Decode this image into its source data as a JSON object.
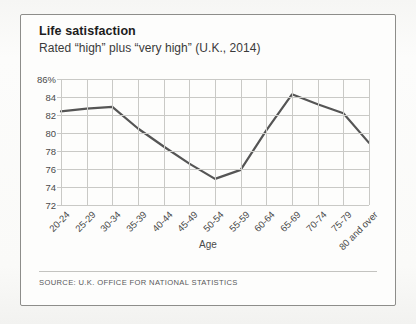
{
  "card": {
    "title": "Life satisfaction",
    "subtitle": "Rated “high” plus “very high” (U.K., 2014)",
    "source": "SOURCE: U.K. OFFICE FOR NATIONAL STATISTICS"
  },
  "chart_data": {
    "type": "line",
    "title": "Life satisfaction",
    "subtitle": "Rated “high” plus “very high” (U.K., 2014)",
    "xlabel": "Age",
    "ylabel": "",
    "categories": [
      "20-24",
      "25-29",
      "30-34",
      "35-39",
      "40-44",
      "45-49",
      "50-54",
      "55-59",
      "60-64",
      "65-69",
      "70-74",
      "75-79",
      "80 and over"
    ],
    "values": [
      82.4,
      82.7,
      82.9,
      80.5,
      78.5,
      76.6,
      74.9,
      75.9,
      80.3,
      84.3,
      83.2,
      82.2,
      78.9
    ],
    "ylim": [
      72,
      86
    ],
    "ytick_labels": [
      "86%",
      "84",
      "82",
      "80",
      "78",
      "76",
      "74",
      "72"
    ],
    "yticks": [
      86,
      84,
      82,
      80,
      78,
      76,
      74,
      72
    ],
    "grid": true,
    "legend": false,
    "line_color": "#555555",
    "grid_color": "#c9c9c6",
    "source": "SOURCE: U.K. OFFICE FOR NATIONAL STATISTICS"
  }
}
